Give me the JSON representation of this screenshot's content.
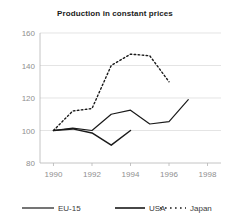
{
  "chart_data": {
    "type": "line",
    "title": "Production in constant prices",
    "xlabel": "",
    "ylabel": "",
    "xlim": [
      1989.3,
      1998.7
    ],
    "ylim": [
      80,
      160
    ],
    "xticks": [
      1990,
      1992,
      1994,
      1996,
      1998
    ],
    "xtick_labels": [
      "1990",
      "1992",
      "1994",
      "1996",
      "1998"
    ],
    "yticks": [
      80,
      100,
      120,
      140,
      160
    ],
    "ytick_labels": [
      "80",
      "100",
      "120",
      "140",
      "160"
    ],
    "grid": true,
    "grid_axis": "y",
    "legend_position": "bottom",
    "series": [
      {
        "name": "EU-15",
        "style": "solid",
        "color": "#1a1a1a",
        "width": 1.2,
        "x": [
          1990,
          1991,
          1992,
          1993,
          1994,
          1995,
          1996,
          1997
        ],
        "values": [
          100,
          101.5,
          100,
          110,
          112.5,
          104,
          105.5,
          119
        ]
      },
      {
        "name": "USA",
        "style": "solid",
        "color": "#1a1a1a",
        "width": 1.5,
        "x": [
          1990,
          1991,
          1992,
          1993,
          1994
        ],
        "values": [
          100,
          101,
          98.5,
          91,
          100
        ]
      },
      {
        "name": "Japan",
        "style": "dotted",
        "color": "#1a1a1a",
        "width": 1.4,
        "x": [
          1990,
          1991,
          1992,
          1993,
          1994,
          1995,
          1996
        ],
        "values": [
          100,
          112,
          113.5,
          140,
          147,
          146,
          130
        ]
      }
    ]
  },
  "legend": {
    "items": [
      {
        "label": "EU-15",
        "style": "solid"
      },
      {
        "label": "USA",
        "style": "solid"
      },
      {
        "label": "Japan",
        "style": "dotted"
      }
    ]
  }
}
